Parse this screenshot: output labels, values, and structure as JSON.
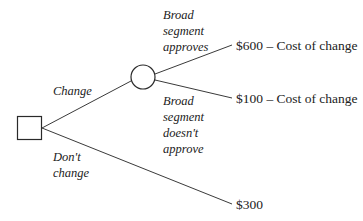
{
  "diagram": {
    "type": "decision-tree",
    "nodes": {
      "decision": {
        "shape": "square",
        "label": ""
      },
      "chance": {
        "shape": "circle",
        "label": ""
      }
    },
    "branches": {
      "change": {
        "label": "Change"
      },
      "dont_change": {
        "label_line1": "Don't",
        "label_line2": "change"
      },
      "approves": {
        "label_line1": "Broad",
        "label_line2": "segment",
        "label_line3": "approves"
      },
      "not_approve": {
        "label_line1": "Broad",
        "label_line2": "segment",
        "label_line3": "doesn't",
        "label_line4": "approve"
      }
    },
    "outcomes": {
      "approves": "$600 – Cost of change",
      "not_approve": "$100 – Cost of change",
      "dont_change": "$300"
    },
    "colors": {
      "line": "#3a3a3a",
      "text": "#222222",
      "background": "#ffffff"
    }
  }
}
